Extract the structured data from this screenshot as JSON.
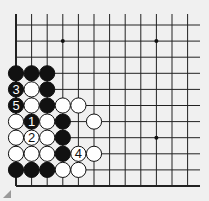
{
  "diagram": {
    "type": "go-board-fragment",
    "grid": {
      "x0": 16,
      "dx": 15.6,
      "cols": 12,
      "y0": 25,
      "dy": 16.1,
      "rows": 11,
      "top_open_y": 14,
      "right_open_x": 200,
      "line_color": "#222222",
      "background": "#f0f0f0"
    },
    "star_points": [
      {
        "col": 3,
        "row": 1
      },
      {
        "col": 9,
        "row": 1
      },
      {
        "col": 9,
        "row": 7
      }
    ],
    "stones": [
      {
        "col": 0,
        "row": 3,
        "color": "black",
        "label": ""
      },
      {
        "col": 1,
        "row": 3,
        "color": "black",
        "label": ""
      },
      {
        "col": 2,
        "row": 3,
        "color": "black",
        "label": ""
      },
      {
        "col": 0,
        "row": 4,
        "color": "black",
        "label": "3"
      },
      {
        "col": 1,
        "row": 4,
        "color": "white",
        "label": ""
      },
      {
        "col": 2,
        "row": 4,
        "color": "black",
        "label": ""
      },
      {
        "col": 0,
        "row": 5,
        "color": "black",
        "label": "5"
      },
      {
        "col": 1,
        "row": 5,
        "color": "white",
        "label": ""
      },
      {
        "col": 2,
        "row": 5,
        "color": "black",
        "label": ""
      },
      {
        "col": 3,
        "row": 5,
        "color": "white",
        "label": ""
      },
      {
        "col": 4,
        "row": 5,
        "color": "white",
        "label": ""
      },
      {
        "col": 0,
        "row": 6,
        "color": "white",
        "label": ""
      },
      {
        "col": 1,
        "row": 6,
        "color": "black",
        "label": "1"
      },
      {
        "col": 2,
        "row": 6,
        "color": "white",
        "label": ""
      },
      {
        "col": 3,
        "row": 6,
        "color": "black",
        "label": ""
      },
      {
        "col": 5,
        "row": 6,
        "color": "white",
        "label": ""
      },
      {
        "col": 0,
        "row": 7,
        "color": "white",
        "label": ""
      },
      {
        "col": 1,
        "row": 7,
        "color": "white",
        "label": "2"
      },
      {
        "col": 2,
        "row": 7,
        "color": "white",
        "label": ""
      },
      {
        "col": 3,
        "row": 7,
        "color": "black",
        "label": ""
      },
      {
        "col": 0,
        "row": 8,
        "color": "white",
        "label": ""
      },
      {
        "col": 1,
        "row": 8,
        "color": "white",
        "label": ""
      },
      {
        "col": 2,
        "row": 8,
        "color": "white",
        "label": ""
      },
      {
        "col": 3,
        "row": 8,
        "color": "black",
        "label": ""
      },
      {
        "col": 4,
        "row": 8,
        "color": "white",
        "label": "4"
      },
      {
        "col": 5,
        "row": 8,
        "color": "white",
        "label": ""
      },
      {
        "col": 0,
        "row": 9,
        "color": "black",
        "label": ""
      },
      {
        "col": 1,
        "row": 9,
        "color": "black",
        "label": ""
      },
      {
        "col": 2,
        "row": 9,
        "color": "black",
        "label": ""
      },
      {
        "col": 3,
        "row": 9,
        "color": "white",
        "label": ""
      },
      {
        "col": 4,
        "row": 9,
        "color": "white",
        "label": ""
      }
    ]
  }
}
